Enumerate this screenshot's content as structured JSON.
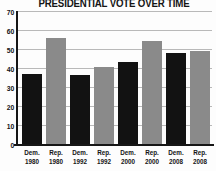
{
  "chart_data": {
    "type": "bar",
    "title": "PRESIDENTIAL VOTE OVER TIME",
    "categories": [
      "Dem. 1980",
      "Rep. 1980",
      "Dem. 1992",
      "Rep. 1992",
      "Dem. 2000",
      "Rep. 2000",
      "Dem. 2008",
      "Rep. 2008"
    ],
    "values": [
      37.5,
      56.5,
      37,
      41,
      43.5,
      55,
      48.5,
      49.5
    ],
    "bar_colors": [
      "#121212",
      "#8a8a8a",
      "#121212",
      "#8a8a8a",
      "#121212",
      "#8a8a8a",
      "#121212",
      "#8a8a8a"
    ],
    "xlabel": "",
    "ylabel": "",
    "ylim": [
      0,
      70
    ],
    "yticks": [
      0,
      10,
      20,
      30,
      40,
      50,
      60,
      70
    ],
    "grid": true,
    "legend": false
  },
  "colors": {
    "dem_bar": "#121212",
    "rep_bar": "#8a8a8a",
    "gridline": "#b9b9b9",
    "axis": "#161616",
    "background": "#fdfdfd",
    "text": "#141414"
  }
}
